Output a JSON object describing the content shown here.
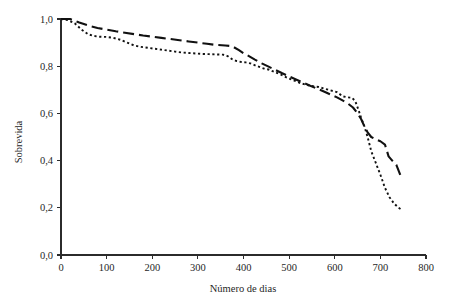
{
  "chart_data": {
    "type": "line",
    "title": "",
    "xlabel": "Número de dias",
    "ylabel": "Sobrevida",
    "xlim": [
      0,
      800
    ],
    "ylim": [
      0.0,
      1.0
    ],
    "grid": false,
    "legend_position": "none",
    "xticks": [
      0,
      100,
      200,
      300,
      400,
      500,
      600,
      700,
      800
    ],
    "xtick_labels": [
      "0",
      "100",
      "200",
      "300",
      "400",
      "500",
      "600",
      "700",
      "800"
    ],
    "yticks": [
      0.0,
      0.2,
      0.4,
      0.6,
      0.8,
      1.0
    ],
    "ytick_labels": [
      "0,0",
      "0,2",
      "0,4",
      "0,6",
      "0,8",
      "1,0"
    ],
    "decimal_separator": ",",
    "series": [
      {
        "name": "curva-tracejada",
        "style": "dashed",
        "color": "#111111",
        "x": [
          0,
          20,
          40,
          60,
          80,
          100,
          120,
          140,
          160,
          180,
          200,
          220,
          240,
          260,
          280,
          300,
          320,
          340,
          360,
          375,
          390,
          400,
          410,
          425,
          440,
          455,
          470,
          485,
          500,
          515,
          530,
          545,
          560,
          575,
          590,
          605,
          620,
          630,
          640,
          650,
          658,
          665,
          672,
          680,
          690,
          700,
          710,
          718,
          726,
          735,
          745
        ],
        "y": [
          1.0,
          1.0,
          0.985,
          0.972,
          0.962,
          0.955,
          0.948,
          0.942,
          0.936,
          0.93,
          0.925,
          0.92,
          0.915,
          0.91,
          0.905,
          0.9,
          0.895,
          0.89,
          0.888,
          0.885,
          0.868,
          0.855,
          0.845,
          0.828,
          0.812,
          0.798,
          0.784,
          0.77,
          0.757,
          0.744,
          0.731,
          0.718,
          0.706,
          0.694,
          0.681,
          0.668,
          0.652,
          0.64,
          0.625,
          0.6,
          0.575,
          0.545,
          0.52,
          0.5,
          0.49,
          0.482,
          0.468,
          0.418,
          0.4,
          0.382,
          0.332
        ]
      },
      {
        "name": "curva-pontilhada",
        "style": "dotted",
        "color": "#111111",
        "x": [
          0,
          15,
          30,
          45,
          60,
          72,
          85,
          100,
          115,
          130,
          145,
          160,
          175,
          190,
          205,
          220,
          235,
          250,
          265,
          280,
          295,
          310,
          325,
          340,
          355,
          365,
          375,
          385,
          395,
          405,
          415,
          430,
          445,
          455,
          465,
          480,
          495,
          510,
          525,
          540,
          555,
          565,
          575,
          590,
          605,
          618,
          628,
          638,
          645,
          652,
          658,
          665,
          672,
          680,
          690,
          700,
          710,
          720,
          730,
          740,
          748
        ],
        "y": [
          1.0,
          0.995,
          0.982,
          0.955,
          0.935,
          0.928,
          0.925,
          0.924,
          0.92,
          0.912,
          0.9,
          0.888,
          0.882,
          0.878,
          0.874,
          0.87,
          0.866,
          0.862,
          0.858,
          0.856,
          0.854,
          0.852,
          0.851,
          0.85,
          0.849,
          0.843,
          0.83,
          0.822,
          0.818,
          0.816,
          0.812,
          0.8,
          0.79,
          0.786,
          0.778,
          0.766,
          0.752,
          0.74,
          0.728,
          0.72,
          0.714,
          0.712,
          0.706,
          0.698,
          0.69,
          0.672,
          0.668,
          0.666,
          0.652,
          0.615,
          0.58,
          0.545,
          0.5,
          0.44,
          0.39,
          0.34,
          0.285,
          0.245,
          0.218,
          0.2,
          0.19
        ]
      }
    ]
  }
}
